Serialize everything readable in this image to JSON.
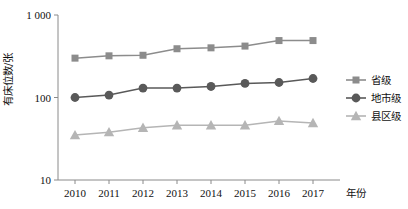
{
  "chart_data": {
    "type": "line",
    "title": "",
    "subtitle": "",
    "xlabel": "年份",
    "ylabel": "有床位数/张",
    "x": [
      "2010",
      "2011",
      "2012",
      "2013",
      "2014",
      "2015",
      "2016",
      "2017"
    ],
    "categories": [
      "2010",
      "2011",
      "2012",
      "2013",
      "2014",
      "2015",
      "2016",
      "2017"
    ],
    "yscale": "log",
    "ylim": [
      10,
      1000
    ],
    "yticks": [
      10,
      100,
      1000
    ],
    "ytick_labels": [
      "10",
      "100",
      "1 000"
    ],
    "grid": false,
    "legend_position": "right",
    "series": [
      {
        "name": "省级",
        "marker": "square",
        "color": "#8c8c8c",
        "values": [
          300,
          320,
          325,
          390,
          400,
          420,
          490,
          490
        ]
      },
      {
        "name": "地市级",
        "marker": "circle",
        "color": "#595959",
        "values": [
          100,
          107,
          130,
          130,
          136,
          148,
          152,
          170
        ]
      },
      {
        "name": "县区级",
        "marker": "triangle",
        "color": "#b5b5b5",
        "values": [
          35,
          38,
          43,
          46,
          46,
          46,
          52,
          49
        ]
      }
    ]
  },
  "axis": {
    "y_label_text": "有床位数/张",
    "x_label_text": "年份",
    "tick_1000": "1 000",
    "tick_100": "100",
    "tick_10": "10"
  },
  "legend": {
    "items": [
      {
        "label": "省级",
        "marker": "square-marker-icon"
      },
      {
        "label": "地市级",
        "marker": "circle-marker-icon"
      },
      {
        "label": "县区级",
        "marker": "triangle-marker-icon"
      }
    ]
  }
}
